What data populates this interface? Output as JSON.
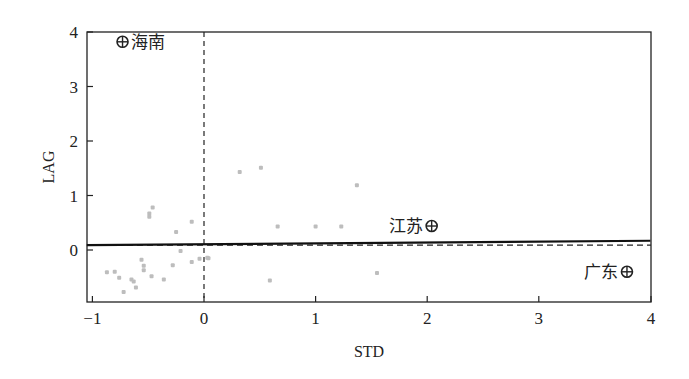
{
  "chart_data": {
    "type": "scatter",
    "title": "",
    "xlabel": "STD",
    "ylabel": "LAG",
    "xlim": [
      -1.05,
      4.0
    ],
    "ylim": [
      -0.95,
      4.0
    ],
    "x_ticks": [
      -1,
      0,
      1,
      2,
      3,
      4
    ],
    "y_ticks": [
      0,
      1,
      2,
      3,
      4
    ],
    "grid": false,
    "legend": null,
    "reference_lines": {
      "vertical_dashed_x": 0,
      "horizontal_dashed_y": 0.09,
      "regression_line": {
        "x": [
          -1.05,
          4.0
        ],
        "y": [
          0.09,
          0.17
        ]
      }
    },
    "series": [
      {
        "name": "provinces",
        "color": "#bdbdbd",
        "points": [
          {
            "x": -0.87,
            "y": -0.41
          },
          {
            "x": -0.8,
            "y": -0.4
          },
          {
            "x": -0.76,
            "y": -0.51
          },
          {
            "x": -0.72,
            "y": -0.77
          },
          {
            "x": -0.65,
            "y": -0.54
          },
          {
            "x": -0.63,
            "y": -0.58
          },
          {
            "x": -0.61,
            "y": -0.69
          },
          {
            "x": -0.56,
            "y": -0.18
          },
          {
            "x": -0.54,
            "y": -0.29
          },
          {
            "x": -0.54,
            "y": -0.37
          },
          {
            "x": -0.49,
            "y": 0.67
          },
          {
            "x": -0.49,
            "y": 0.61
          },
          {
            "x": -0.46,
            "y": 0.78
          },
          {
            "x": -0.47,
            "y": -0.48
          },
          {
            "x": -0.36,
            "y": -0.54
          },
          {
            "x": -0.28,
            "y": -0.28
          },
          {
            "x": -0.25,
            "y": 0.33
          },
          {
            "x": -0.21,
            "y": -0.02
          },
          {
            "x": -0.11,
            "y": -0.22
          },
          {
            "x": -0.11,
            "y": 0.52
          },
          {
            "x": -0.04,
            "y": -0.16
          },
          {
            "x": 0.04,
            "y": -0.15
          },
          {
            "x": 0.03,
            "y": -0.14
          },
          {
            "x": 0.32,
            "y": 1.43
          },
          {
            "x": 0.51,
            "y": 1.51
          },
          {
            "x": 0.66,
            "y": 0.43
          },
          {
            "x": 1.0,
            "y": 0.43
          },
          {
            "x": 0.59,
            "y": -0.56
          },
          {
            "x": 1.55,
            "y": -0.42
          },
          {
            "x": 1.37,
            "y": 1.19
          },
          {
            "x": 1.23,
            "y": 0.43
          }
        ]
      },
      {
        "name": "labeled",
        "color": "#222222",
        "marker": "circle-cross",
        "points": [
          {
            "x": -0.73,
            "y": 3.82,
            "label": "海南",
            "label_side": "right"
          },
          {
            "x": 2.04,
            "y": 0.44,
            "label": "江苏",
            "label_side": "left"
          },
          {
            "x": 3.79,
            "y": -0.4,
            "label": "广东",
            "label_side": "left"
          }
        ]
      }
    ]
  }
}
